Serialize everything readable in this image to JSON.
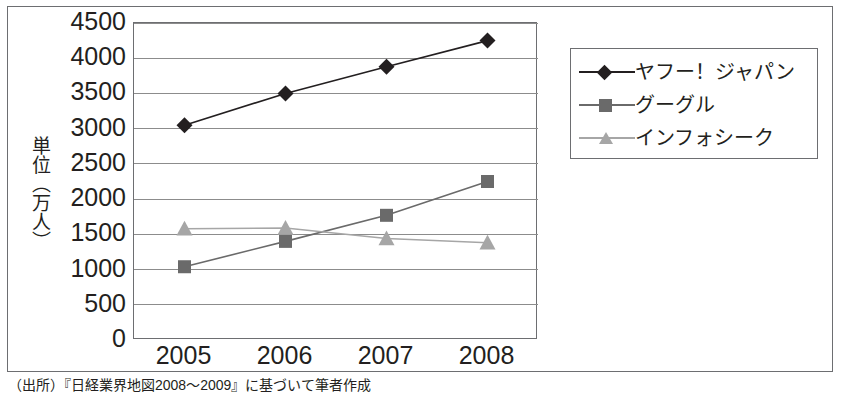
{
  "chart_data": {
    "type": "line",
    "title": "",
    "xlabel": "",
    "ylabel": "単位（万人）",
    "categories": [
      "2005",
      "2006",
      "2007",
      "2008"
    ],
    "ylim": [
      0,
      4500
    ],
    "ytick_step": 500,
    "yticks": [
      "4500",
      "4000",
      "3500",
      "3000",
      "2500",
      "2000",
      "1500",
      "1000",
      "500",
      "0"
    ],
    "grid": "horizontal",
    "legend_position": "right",
    "series": [
      {
        "name": "ヤフー！ジャパン",
        "values": [
          3050,
          3500,
          3880,
          4250
        ],
        "color": "#231f20",
        "marker": "diamond"
      },
      {
        "name": "グーグル",
        "values": [
          1040,
          1400,
          1770,
          2250
        ],
        "color": "#6a6a6a",
        "marker": "square"
      },
      {
        "name": "インフォシーク",
        "values": [
          1580,
          1590,
          1440,
          1380
        ],
        "color": "#a6a6a6",
        "marker": "triangle"
      }
    ]
  },
  "caption": {
    "source_note": "（出所）『日経業界地図2008〜2009』に基づいて筆者作成"
  },
  "colors": {
    "frame": "#6d6e71",
    "gridline": "#8c8c8c",
    "text": "#231f20",
    "background": "#ffffff"
  }
}
